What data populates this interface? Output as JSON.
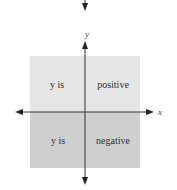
{
  "diagram": {
    "axes": {
      "x_label": "x",
      "y_label": "y"
    },
    "regions": {
      "upper": {
        "fill": "#e6e6e6",
        "left_text": "y is",
        "right_text": "positive"
      },
      "lower": {
        "fill": "#cfcfcf",
        "left_text": "y is",
        "right_text": "negative"
      }
    },
    "colors": {
      "axis_line": "#333333",
      "text": "#333333",
      "background": "#ffffff"
    }
  }
}
